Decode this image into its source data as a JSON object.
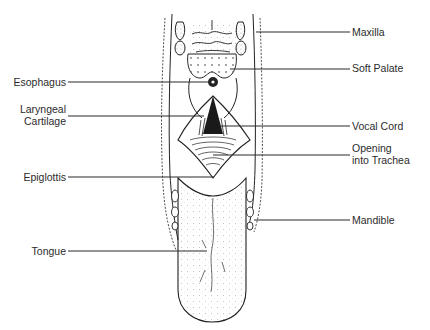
{
  "diagram": {
    "type": "anatomical-illustration",
    "line_color": "#2b2b2b",
    "labels_left": [
      {
        "id": "esophagus",
        "text": "Esophagus"
      },
      {
        "id": "laryngeal-cartilage",
        "line1": "Laryngeal",
        "line2": "Cartilage"
      },
      {
        "id": "epiglottis",
        "text": "Epiglottis"
      },
      {
        "id": "tongue",
        "text": "Tongue"
      }
    ],
    "labels_right": [
      {
        "id": "maxilla",
        "text": "Maxilla"
      },
      {
        "id": "soft-palate",
        "text": "Soft Palate"
      },
      {
        "id": "vocal-cord",
        "text": "Vocal Cord"
      },
      {
        "id": "opening-into-trachea",
        "line1": "Opening",
        "line2": "into Trachea"
      },
      {
        "id": "mandible",
        "text": "Mandible"
      }
    ]
  }
}
